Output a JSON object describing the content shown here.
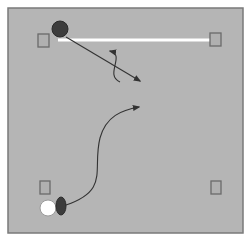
{
  "diagram": {
    "type": "sports-play-diagram",
    "colors": {
      "background": "#ffffff",
      "field": "#b5b5b5",
      "field_border": "#7a7a7a",
      "line": "#ffffff",
      "marker_fill": "#b0b0b0",
      "marker_stroke": "#6a6a6a",
      "dark_player": "#3c3c3c",
      "light_player": "#ffffff",
      "path": "#333333"
    },
    "field": {
      "x": 8,
      "y": 8,
      "width": 235,
      "height": 225
    },
    "white_line": {
      "x1": 58,
      "y1": 40,
      "x2": 213,
      "y2": 40
    },
    "markers": [
      {
        "name": "marker-top-left",
        "x": 38,
        "y": 34,
        "w": 11,
        "h": 13
      },
      {
        "name": "marker-top-right",
        "x": 210,
        "y": 33,
        "w": 11,
        "h": 13
      },
      {
        "name": "marker-bottom-left",
        "x": 40,
        "y": 181,
        "w": 10,
        "h": 13
      },
      {
        "name": "marker-bottom-right",
        "x": 211,
        "y": 181,
        "w": 10,
        "h": 13
      }
    ],
    "players": [
      {
        "name": "dark-ball-top",
        "shape": "circle",
        "cx": 60,
        "cy": 29,
        "r": 8
      },
      {
        "name": "white-ball-bottom",
        "shape": "circle",
        "cx": 48,
        "cy": 208,
        "r": 8
      },
      {
        "name": "dark-oval-bottom",
        "shape": "ellipse",
        "cx": 61,
        "cy": 206,
        "rx": 5,
        "ry": 9
      }
    ],
    "paths": [
      {
        "name": "straight-run-path",
        "d": "M 66 37 L 140 81"
      },
      {
        "name": "s-curve-path",
        "d": "M 120 82 C 104 75, 126 55, 110 51"
      },
      {
        "name": "curved-run-path",
        "d": "M 66 205 C 110 190, 92 170, 100 138 C 106 116, 122 110, 139 107"
      }
    ]
  }
}
